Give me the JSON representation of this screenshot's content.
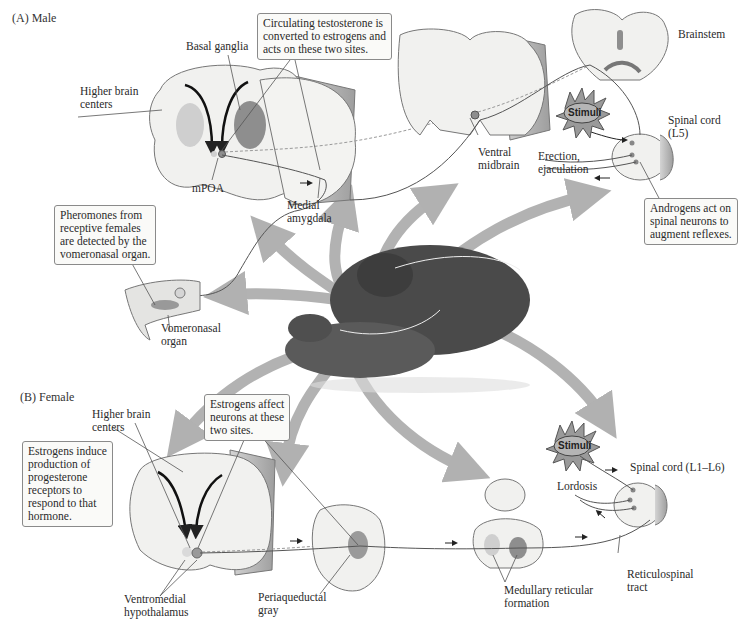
{
  "sections": {
    "male": "(A)  Male",
    "female": "(B)  Female"
  },
  "male": {
    "callout_testosterone": "Circulating testosterone is\nconverted to estrogens and\nacts on these two sites.",
    "callout_pheromones": "Pheromones from\nreceptive females\nare detected by the\nvomeronasal organ.",
    "callout_androgens": "Androgens act on\nspinal neurons to\naugment reflexes.",
    "labels": {
      "basal_ganglia": "Basal ganglia",
      "higher_brain_centers": "Higher brain\ncenters",
      "mpoa": "mPOA",
      "medial_amygdala": "Medial\namygdala",
      "ventral_midbrain": "Ventral\nmidbrain",
      "brainstem": "Brainstem",
      "spinal_cord": "Spinal cord\n(L5)",
      "erection": "Erection,\nejaculation",
      "vomeronasal_organ": "Vomeronasal\norgan",
      "stimuli": "Stimuli"
    }
  },
  "female": {
    "callout_estrogens_affect": "Estrogens affect\nneurons at these\ntwo sites.",
    "callout_estrogens_induce": "Estrogens induce\nproduction of\nprogesterone\nreceptors to\nrespond to that\nhormone.",
    "labels": {
      "higher_brain_centers": "Higher brain\ncenters",
      "ventromedial_hypothalamus": "Ventromedial\nhypothalamus",
      "periaqueductal_gray": "Periaqueductal\ngray",
      "medullary_reticular_formation": "Medullary reticular\nformation",
      "reticulospinal_tract": "Reticulospinal\ntract",
      "spinal_cord": "Spinal cord (L1–L6)",
      "lordosis": "Lordosis",
      "stimuli": "Stimuli"
    }
  },
  "colors": {
    "arrow_gray": "#a9a9a9",
    "brain_fill": "#f1f1ef",
    "brain_side": "#b8b8b8",
    "nucleus_dark": "#8e8e8e",
    "nucleus_light": "#c9c9c9",
    "stimuli_fill": "#a8a8a8"
  }
}
